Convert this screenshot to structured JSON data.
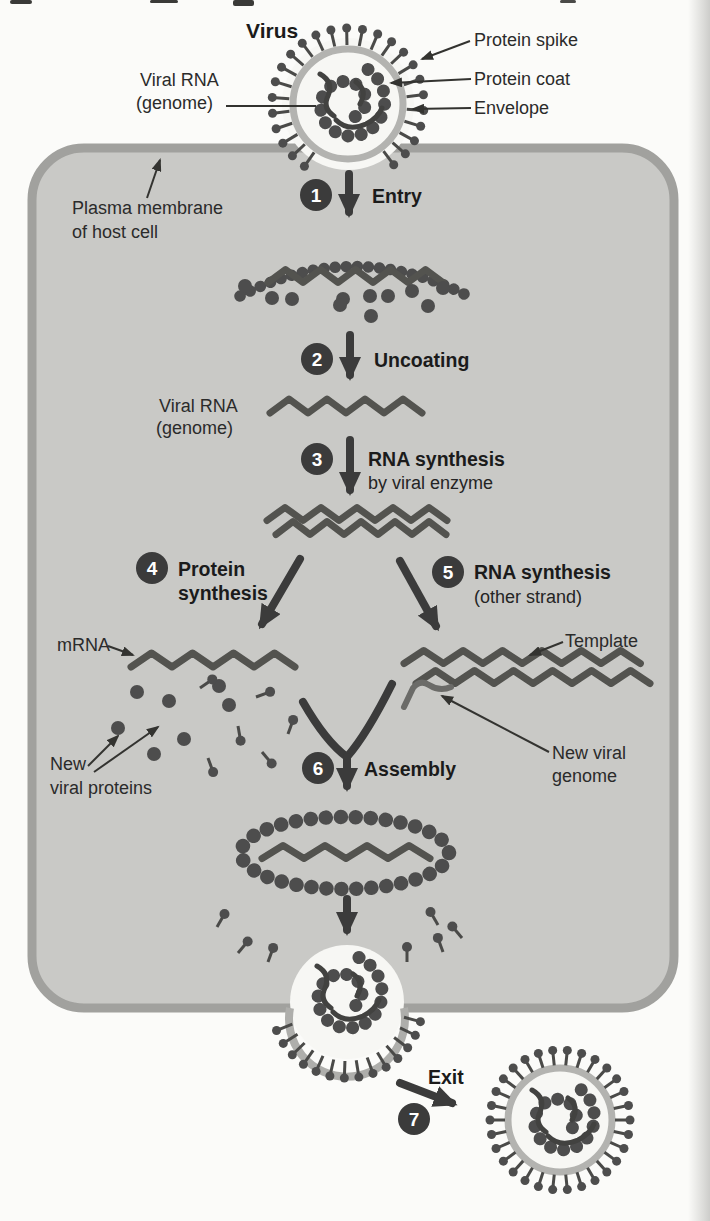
{
  "figure_labels": {
    "virus_title": "Virus",
    "protein_spike": "Protein spike",
    "protein_coat": "Protein coat",
    "envelope": "Envelope",
    "viral_rna_1": "Viral RNA",
    "viral_rna_2": "(genome)",
    "plasma_membrane_1": "Plasma membrane",
    "plasma_membrane_2": "of host cell",
    "uncoated_rna_1": "Viral RNA",
    "uncoated_rna_2": "(genome)",
    "mrna": "mRNA",
    "template": "Template",
    "new_viral_genome_1": "New viral",
    "new_viral_genome_2": "genome",
    "new_viral_proteins_1": "New",
    "new_viral_proteins_2": "viral proteins"
  },
  "steps": [
    {
      "num": "1",
      "label": "Entry"
    },
    {
      "num": "2",
      "label": "Uncoating"
    },
    {
      "num": "3",
      "label": "RNA synthesis",
      "sub": "by viral enzyme"
    },
    {
      "num": "4",
      "label": "Protein",
      "label2": "synthesis"
    },
    {
      "num": "5",
      "label": "RNA synthesis",
      "sub": "(other strand)"
    },
    {
      "num": "6",
      "label": "Assembly"
    },
    {
      "num": "7",
      "label": "Exit"
    }
  ],
  "colors": {
    "page": "#fbfbf9",
    "cell_fill": "#c9c9c6",
    "membrane": "#a1a19e",
    "bead": "#4d4d4d",
    "envelope_ring": "#b3b3b0",
    "accent_dark": "#3b3b3b"
  }
}
